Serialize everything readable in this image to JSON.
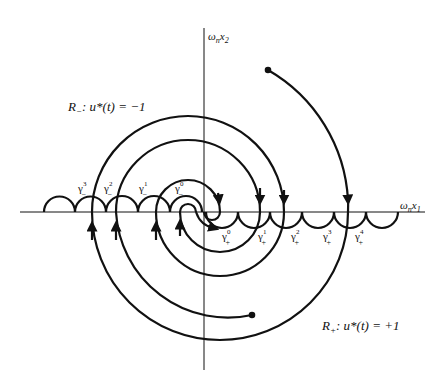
{
  "axes": {
    "x_label": "ω",
    "x_label_sub": "n",
    "x_label_var": "x",
    "x_label_var_sub": "1",
    "y_label": "ω",
    "y_label_sub": "n",
    "y_label_var": "x",
    "y_label_var_sub": "2"
  },
  "regions": {
    "minus": {
      "name": "R",
      "sub": "−",
      "eq": ": u*(t) = −1"
    },
    "plus": {
      "name": "R",
      "sub": "+",
      "eq": ": u*(t) = +1"
    }
  },
  "switching_labels": {
    "minus": [
      {
        "sym": "γ",
        "sup": "3",
        "sub": "−"
      },
      {
        "sym": "γ",
        "sup": "2",
        "sub": "−"
      },
      {
        "sym": "γ",
        "sup": "1",
        "sub": "−"
      },
      {
        "sym": "γ",
        "sup": "0",
        "sub": "−"
      }
    ],
    "plus": [
      {
        "sym": "γ",
        "sup": "0",
        "sub": "+"
      },
      {
        "sym": "γ",
        "sup": "1",
        "sub": "+"
      },
      {
        "sym": "γ",
        "sup": "2",
        "sub": "+"
      },
      {
        "sym": "γ",
        "sup": "3",
        "sub": "+"
      },
      {
        "sym": "γ",
        "sup": "4",
        "sub": "+"
      }
    ]
  },
  "colors": {
    "ink": "#111111",
    "background": "#ffffff"
  }
}
